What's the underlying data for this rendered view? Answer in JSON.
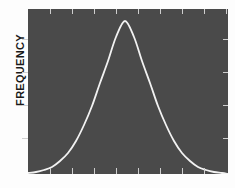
{
  "figure": {
    "background_color": "#fdfdfd",
    "panel_color": "#4a4a4a",
    "curve_color": "#f2f2f2",
    "tick_color": "#cfcfcf",
    "ylabel": "FREQUENCY"
  },
  "chart_data": {
    "type": "line",
    "title": "",
    "xlabel": "",
    "ylabel": "FREQUENCY",
    "grid": false,
    "legend": null,
    "xlim": [
      0,
      200
    ],
    "ylim": [
      0,
      165
    ],
    "axis_tick_labels": {
      "x": [],
      "y": []
    },
    "ticks": {
      "top_count": 9,
      "bottom_count": 8,
      "left_count": 4,
      "right_count": 4,
      "top_positions": [
        22,
        44,
        66,
        88,
        110,
        132,
        154,
        176,
        198
      ],
      "bottom_positions": [
        22,
        44,
        66,
        88,
        110,
        132,
        154,
        176
      ],
      "left_positions": [
        30,
        63,
        96,
        129
      ],
      "right_positions": [
        30,
        63,
        96,
        129
      ]
    },
    "distribution": {
      "shape": "gaussian",
      "peak_x": 97,
      "peak_y": 12,
      "sigma": 34,
      "baseline_y": 165
    },
    "series": [
      {
        "name": "frequency-curve",
        "x": [
          0,
          8,
          16,
          24,
          32,
          40,
          48,
          56,
          64,
          72,
          80,
          88,
          97,
          106,
          114,
          122,
          130,
          138,
          146,
          154,
          162,
          170,
          178,
          186,
          194,
          200
        ],
        "y": [
          164,
          163,
          161,
          158,
          152,
          144,
          132,
          116,
          97,
          74,
          52,
          28,
          12,
          28,
          52,
          74,
          97,
          116,
          132,
          144,
          152,
          158,
          161,
          163,
          164,
          165
        ]
      }
    ]
  }
}
